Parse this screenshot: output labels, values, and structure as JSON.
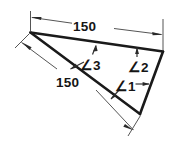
{
  "figure": {
    "kind": "engineering-sketch",
    "background_color": "#ffffff",
    "outline_color": "#1a1a1a",
    "dimension_color": "#555555",
    "text_color": "#151515",
    "dimensions": [
      {
        "id": "top-dimension",
        "label": "150",
        "value": 150,
        "applies_to": "top-edge",
        "placement": "above",
        "arrow_style": "both-ends-inward"
      },
      {
        "id": "lower-dimension",
        "label": "150",
        "value": 150,
        "applies_to": "long-edge",
        "placement": "below-left",
        "arrow_style": "both-ends-inward"
      }
    ],
    "angles": [
      {
        "id": "angle-1",
        "label": "∠1",
        "at_vertex": "right-vertex"
      },
      {
        "id": "angle-2",
        "label": "∠2",
        "at_vertex": "top-right-vertex"
      },
      {
        "id": "angle-3",
        "label": "∠3",
        "at_vertex": "left-apex"
      }
    ],
    "vertices": [
      {
        "id": "left-apex",
        "x": 30,
        "y": 32
      },
      {
        "id": "top-right-vertex",
        "x": 163,
        "y": 51
      },
      {
        "id": "bottom-right-vertex",
        "x": 140,
        "y": 114
      }
    ]
  }
}
